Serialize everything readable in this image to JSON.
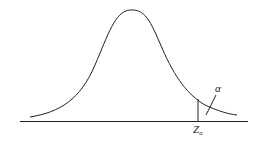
{
  "diagram": {
    "type": "normal-distribution-upper-tail",
    "critical_value_label": "Z",
    "critical_value_subscript": "α",
    "tail_area_label": "α",
    "colors": {
      "stroke": "#222222",
      "background": "#ffffff"
    }
  }
}
